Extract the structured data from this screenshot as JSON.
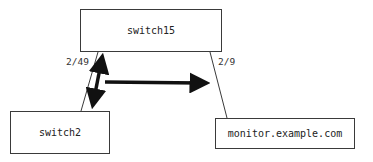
{
  "nodes": {
    "top": "switch15",
    "left": "switch2",
    "right": "monitor.example.com"
  },
  "ports": {
    "left_link": "2/49",
    "right_link": "2/9"
  },
  "arrows": [
    {
      "name": "bidirectional-link-arrow",
      "direction": "both",
      "between": [
        "switch15",
        "switch2"
      ]
    },
    {
      "name": "traffic-mirror-arrow",
      "direction": "forward",
      "to": "monitor.example.com"
    }
  ],
  "colors": {
    "line": "#3a3a3a",
    "arrow": "#111111"
  }
}
